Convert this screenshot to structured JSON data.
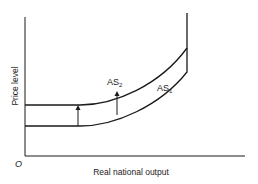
{
  "diagram": {
    "title": "",
    "axes": {
      "y_label": "Price level",
      "x_label": "Real national output",
      "origin_label": "O"
    },
    "curves": [
      {
        "id": "AS1",
        "label_main": "AS",
        "label_sub": "1"
      },
      {
        "id": "AS2",
        "label_main": "AS",
        "label_sub": "2"
      }
    ],
    "annotations": [
      {
        "type": "arrow",
        "direction": "up",
        "from": "AS1",
        "to": "AS2",
        "position": "flat segment"
      },
      {
        "type": "arrow",
        "direction": "up",
        "from": "AS1",
        "to": "AS2",
        "position": "curved segment"
      }
    ],
    "colors": {
      "line": "#1a1a1a",
      "background": "#ffffff"
    }
  }
}
